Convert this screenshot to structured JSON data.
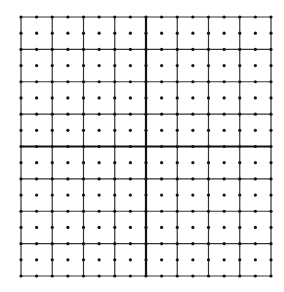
{
  "diagram": {
    "type": "dot-grid",
    "bounds": {
      "left": 21,
      "top": 17,
      "right": 271,
      "bottom": 276
    },
    "cells_x": 8,
    "cells_y": 8,
    "subdivisions": 2,
    "axis_index_x": 4,
    "axis_index_y": 4,
    "colors": {
      "line": "#333333",
      "axis": "#111111",
      "dot": "#111111",
      "background": "#ffffff"
    },
    "line_width": 1.2,
    "axis_width": 2.2,
    "dot_radius": 1.6
  }
}
